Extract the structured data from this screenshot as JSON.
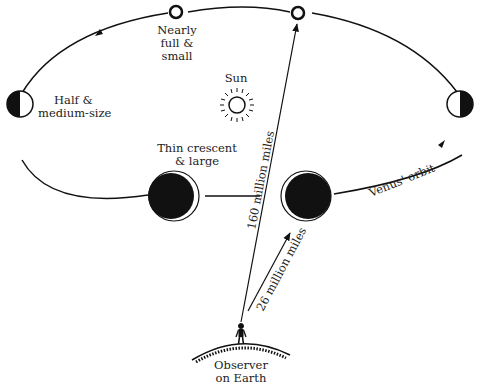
{
  "diagram": {
    "colors": {
      "ink": "#111111",
      "background": "#ffffff",
      "text": "#222222"
    },
    "labels": {
      "nearly_full_1": "Nearly",
      "nearly_full_2": "full &",
      "nearly_full_3": "small",
      "sun": "Sun",
      "half_1": "Half &",
      "half_2": "medium-size",
      "crescent_1": "Thin crescent",
      "crescent_2": "& large",
      "dist_far": "160 million miles",
      "dist_near": "26 million miles",
      "orbit": "Venus' orbit",
      "observer_1": "Observer",
      "observer_2": "on Earth"
    },
    "phases": [
      {
        "name": "nearly-full-left",
        "size": "small"
      },
      {
        "name": "full-far-side",
        "size": "small"
      },
      {
        "name": "half-left",
        "size": "medium"
      },
      {
        "name": "half-right",
        "size": "medium"
      },
      {
        "name": "thin-crescent-left",
        "size": "large"
      },
      {
        "name": "thin-crescent-right",
        "size": "large"
      }
    ]
  }
}
